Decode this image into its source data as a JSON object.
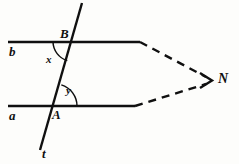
{
  "figure": {
    "background_color": "#fdfdfb",
    "ink_color": "#101010",
    "labels": {
      "line_b": "b",
      "line_a": "a",
      "point_B": "B",
      "point_A": "A",
      "angle_x": "x",
      "angle_y": "y",
      "transversal_t": "t",
      "point_N": "N"
    },
    "geometry": {
      "line_b": {
        "x1": 8,
        "y1": 42,
        "x2": 140,
        "y2": 42,
        "style": "solid"
      },
      "line_a": {
        "x1": 8,
        "y1": 106,
        "x2": 135,
        "y2": 106,
        "style": "solid"
      },
      "transversal": {
        "x1": 82,
        "y1": 3,
        "x2": 40,
        "y2": 150,
        "style": "solid"
      },
      "dashed_upper": {
        "x1": 140,
        "y1": 42,
        "x2": 209,
        "y2": 79,
        "style": "dashed"
      },
      "dashed_lower": {
        "x1": 135,
        "y1": 106,
        "x2": 209,
        "y2": 83,
        "style": "dashed"
      },
      "intersection_B": {
        "x": 73,
        "y": 42
      },
      "intersection_A": {
        "x": 55,
        "y": 106
      },
      "vertex_N": {
        "x": 210,
        "y": 81
      },
      "arc_x": {
        "cx": 73,
        "cy": 42,
        "r": 20,
        "opens": "lower-left"
      },
      "arc_y": {
        "cx": 55,
        "cy": 106,
        "r": 22,
        "opens": "upper-right"
      }
    }
  }
}
